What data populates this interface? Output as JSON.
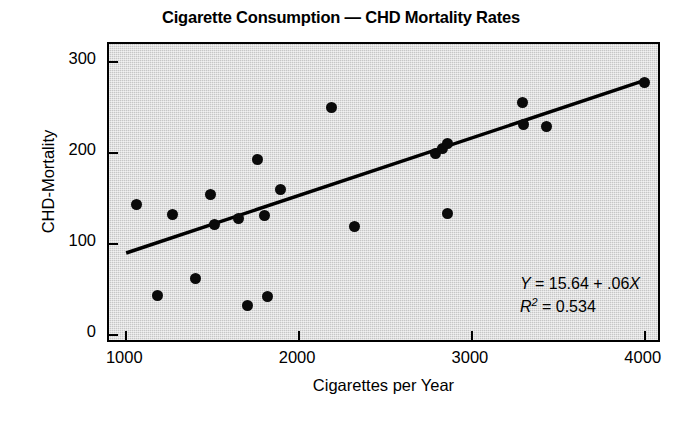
{
  "chart_data": {
    "type": "scatter",
    "title": "Cigarette Consumption — CHD Mortality Rates",
    "xlabel": "Cigarettes per Year",
    "ylabel": "CHD-Mortality",
    "xlim": [
      900,
      4100
    ],
    "ylim": [
      -10,
      320
    ],
    "xticks": [
      1000,
      2000,
      3000,
      4000
    ],
    "xtick_labels": [
      "1000",
      "2000",
      "3000",
      "4000"
    ],
    "yticks": [
      0,
      100,
      200,
      300
    ],
    "ytick_labels": [
      "0",
      "100",
      "200",
      "300"
    ],
    "grid": false,
    "legend": "none",
    "plot_background": "#c6c6c6",
    "point_color": "#0a0a0a",
    "line_color": "#000000",
    "points": [
      {
        "x": 1060,
        "y": 143
      },
      {
        "x": 1180,
        "y": 43
      },
      {
        "x": 1270,
        "y": 133
      },
      {
        "x": 1400,
        "y": 62
      },
      {
        "x": 1490,
        "y": 155
      },
      {
        "x": 1510,
        "y": 121
      },
      {
        "x": 1650,
        "y": 128
      },
      {
        "x": 1700,
        "y": 32
      },
      {
        "x": 1760,
        "y": 193
      },
      {
        "x": 1800,
        "y": 131
      },
      {
        "x": 1820,
        "y": 42
      },
      {
        "x": 1890,
        "y": 160
      },
      {
        "x": 2190,
        "y": 250
      },
      {
        "x": 2320,
        "y": 119
      },
      {
        "x": 2790,
        "y": 200
      },
      {
        "x": 2830,
        "y": 205
      },
      {
        "x": 2860,
        "y": 211
      },
      {
        "x": 2860,
        "y": 134
      },
      {
        "x": 3290,
        "y": 256
      },
      {
        "x": 3300,
        "y": 232
      },
      {
        "x": 3430,
        "y": 229
      },
      {
        "x": 4000,
        "y": 278
      }
    ],
    "regression": {
      "equation": "Y = 15.64 + .06X",
      "equation_y": "Y",
      "equation_rest": " = 15.64 + .06",
      "equation_x": "X",
      "r_squared_label": "R",
      "r_squared_exponent": "2",
      "r_squared_value": " = 0.534",
      "intercept": 15.64,
      "slope": 0.06,
      "r_squared": 0.534,
      "x_start": 1000,
      "x_end": 4000,
      "y_start": 87,
      "y_end": 278
    }
  }
}
